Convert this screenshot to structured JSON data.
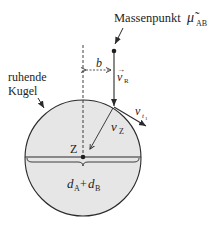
{
  "labels": {
    "particle": "Massenpunkt",
    "mu_symbol": "μ̃",
    "mu_sub": "AB",
    "impact_param": "b",
    "v_R": "v",
    "v_R_sub": "R",
    "v_R_vec": "→",
    "sphere_line1": "ruhende",
    "sphere_line2": "Kugel",
    "v_t": "v",
    "v_t_sub": "t",
    "v_t_subsub": "1",
    "v_Z": "v",
    "v_Z_sub": "Z",
    "center": "Z",
    "diameter_a": "d",
    "diameter_a_sub": "A",
    "plus": "+",
    "diameter_b": "d",
    "diameter_b_sub": "B"
  },
  "colors": {
    "sphere_fill": "#e6e6e6",
    "line": "#2a2a2a"
  }
}
